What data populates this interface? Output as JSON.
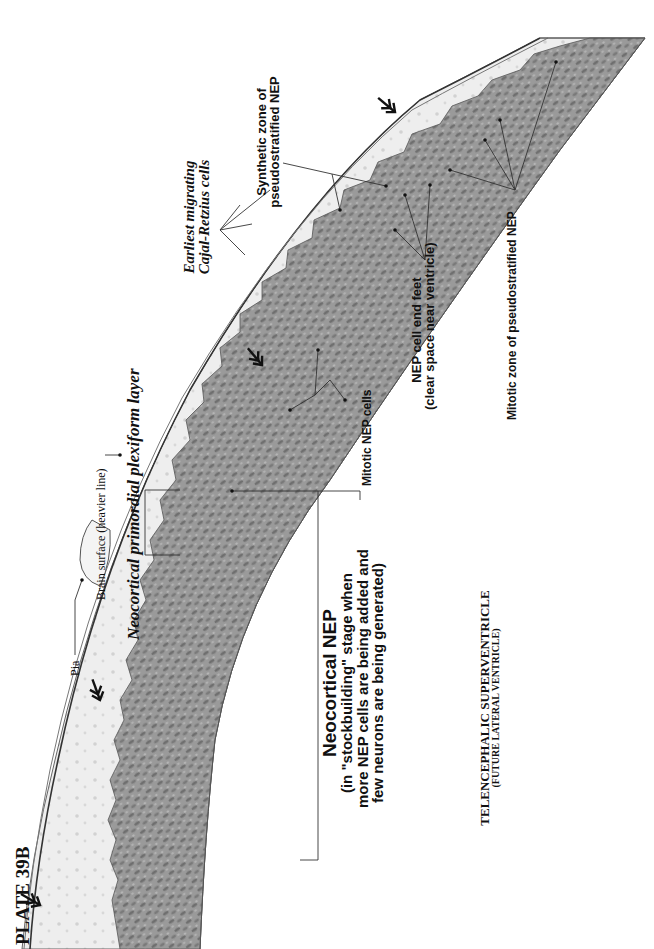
{
  "plate": {
    "title": "PLATE 39B"
  },
  "labels": {
    "pia": "Pia",
    "brain_surface": "Brain surface (heavier line)",
    "primordial_plexiform": "Neocortical primordial plexiform layer",
    "cajal_retzius_line1": "Earliest migrating",
    "cajal_retzius_line2": "Cajal-Retzius cells",
    "synthetic_zone_line1": "Synthetic zone of",
    "synthetic_zone_line2": "pseudostratified NEP",
    "mitotic_nep_cells": "Mitotic NEP cells",
    "end_feet_line1": "NEP cell end feet",
    "end_feet_line2": "(clear space near ventricle)",
    "mitotic_zone": "Mitotic zone of pseudostratified NEP",
    "neocortical_nep_title": "Neocortical NEP",
    "neocortical_nep_line1": "(in \"stockbuilding\" stage when",
    "neocortical_nep_line2": "more NEP cells are being added and",
    "neocortical_nep_line3": "few neurons are being generated)",
    "ventricle_line1": "TELENCEPHALIC SUPERVENTRICLE",
    "ventricle_line2": "(FUTURE LATERAL VENTRICLE)"
  },
  "colors": {
    "background": "#ffffff",
    "tissue_light": "#ececec",
    "tissue_dark": "#8a8a8a",
    "line": "#444444",
    "text": "#111111"
  }
}
